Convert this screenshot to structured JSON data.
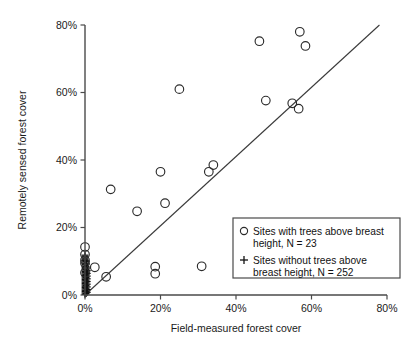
{
  "chart_data": {
    "type": "scatter",
    "title": "",
    "xlabel": "Field-measured forest cover",
    "ylabel": "Remotely sensed forest cover",
    "xlim": [
      0,
      80
    ],
    "ylim": [
      0,
      80
    ],
    "xticks": [
      "0%",
      "20%",
      "40%",
      "60%",
      "80%"
    ],
    "xtickvalues": [
      0,
      20,
      40,
      60,
      80
    ],
    "yticks": [
      "0%",
      "20%",
      "40%",
      "60%",
      "80%"
    ],
    "ytickvalues": [
      0,
      20,
      40,
      60,
      80
    ],
    "grid": false,
    "legend_position": "lower-right",
    "reference_line": {
      "name": "one-to-one-line",
      "x_start": 0,
      "y_start": 0,
      "x_end": 78,
      "y_end": 80
    },
    "series": [
      {
        "name": "Sites with trees above breast height",
        "marker": "open-circle",
        "count": 23,
        "points": [
          [
            0.0,
            14.2
          ],
          [
            0.0,
            10.3
          ],
          [
            0.0,
            9.4
          ],
          [
            0.0,
            6.6
          ],
          [
            2.6,
            8.2
          ],
          [
            5.6,
            5.4
          ],
          [
            6.8,
            31.3
          ],
          [
            13.8,
            24.8
          ],
          [
            18.6,
            8.4
          ],
          [
            18.6,
            6.3
          ],
          [
            20.0,
            36.5
          ],
          [
            21.2,
            27.2
          ],
          [
            25.0,
            61.0
          ],
          [
            30.9,
            8.5
          ],
          [
            32.8,
            36.5
          ],
          [
            34.0,
            38.5
          ],
          [
            46.2,
            75.2
          ],
          [
            47.9,
            57.6
          ],
          [
            54.9,
            56.8
          ],
          [
            56.6,
            55.2
          ],
          [
            56.9,
            78.0
          ],
          [
            58.4,
            73.8
          ],
          [
            0.0,
            12.0
          ]
        ]
      },
      {
        "name": "Sites without trees above breast height",
        "marker": "plus",
        "count": 252,
        "points": [
          [
            0.0,
            0.2
          ],
          [
            0.0,
            0.6
          ],
          [
            0.0,
            1.0
          ],
          [
            0.0,
            1.4
          ],
          [
            0.0,
            1.8
          ],
          [
            0.0,
            2.2
          ],
          [
            0.0,
            2.6
          ],
          [
            0.0,
            3.0
          ],
          [
            0.0,
            3.4
          ],
          [
            0.0,
            3.8
          ],
          [
            0.0,
            4.2
          ],
          [
            0.0,
            4.6
          ],
          [
            0.0,
            5.0
          ],
          [
            0.0,
            5.4
          ],
          [
            0.0,
            5.8
          ],
          [
            0.0,
            6.2
          ],
          [
            0.0,
            6.6
          ],
          [
            0.0,
            7.0
          ],
          [
            0.0,
            7.4
          ],
          [
            0.0,
            7.8
          ],
          [
            0.0,
            8.2
          ],
          [
            0.0,
            8.6
          ],
          [
            0.0,
            9.0
          ],
          [
            0.0,
            9.4
          ],
          [
            0.0,
            9.8
          ],
          [
            0.0,
            10.2
          ],
          [
            0.0,
            10.6
          ],
          [
            0.0,
            11.0
          ],
          [
            0.0,
            11.4
          ],
          [
            0.0,
            11.8
          ],
          [
            0.3,
            0.4
          ],
          [
            0.3,
            1.2
          ],
          [
            0.3,
            2.0
          ],
          [
            0.3,
            2.8
          ],
          [
            0.3,
            3.6
          ],
          [
            0.3,
            4.4
          ],
          [
            0.3,
            5.2
          ],
          [
            0.3,
            6.0
          ],
          [
            0.3,
            6.8
          ],
          [
            0.3,
            7.6
          ],
          [
            0.3,
            8.4
          ],
          [
            0.3,
            9.2
          ],
          [
            0.3,
            10.0
          ],
          [
            0.6,
            0.8
          ],
          [
            0.6,
            1.6
          ],
          [
            0.6,
            2.4
          ],
          [
            0.6,
            3.2
          ],
          [
            0.6,
            4.0
          ],
          [
            0.6,
            4.8
          ],
          [
            0.6,
            5.6
          ],
          [
            0.6,
            6.4
          ],
          [
            0.6,
            7.2
          ],
          [
            0.6,
            8.0
          ]
        ]
      }
    ]
  },
  "legend": {
    "entries": [
      {
        "marker": "open-circle",
        "line1": "Sites with trees above breast",
        "line2": "height, N = 23"
      },
      {
        "marker": "plus",
        "line1": "+ Sites without trees above",
        "line2": "breast height, N = 252"
      }
    ],
    "entry1_line1": "Sites with trees above breast",
    "entry1_line2": "height, N = 23",
    "entry2_line1": "Sites without trees above",
    "entry2_line2": "breast height, N = 252"
  },
  "axes": {
    "x_title": "Field-measured forest cover",
    "y_title": "Remotely sensed forest cover",
    "x_tick_0": "0%",
    "x_tick_1": "20%",
    "x_tick_2": "40%",
    "x_tick_3": "60%",
    "x_tick_4": "80%",
    "y_tick_0": "0%",
    "y_tick_1": "20%",
    "y_tick_2": "40%",
    "y_tick_3": "60%",
    "y_tick_4": "80%"
  },
  "colors": {
    "axis": "#4a4a4a",
    "marker": "#2b2b2b",
    "text": "#1a1a1a",
    "background": "#ffffff"
  }
}
